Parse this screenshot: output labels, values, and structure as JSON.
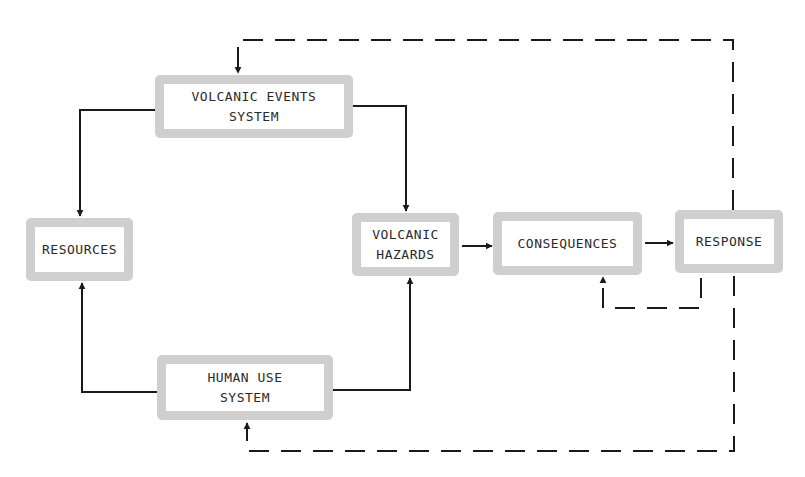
{
  "diagram": {
    "nodes": {
      "volcanic_events": {
        "line1": "VOLCANIC EVENTS",
        "line2": "SYSTEM"
      },
      "resources": {
        "line1": "RESOURCES"
      },
      "volcanic_hazards": {
        "line1": "VOLCANIC",
        "line2": "HAZARDS"
      },
      "consequences": {
        "line1": "CONSEQUENCES"
      },
      "response": {
        "line1": "RESPONSE"
      },
      "human_use": {
        "line1": "HUMAN USE",
        "line2": "SYSTEM"
      }
    },
    "edges": [
      {
        "from": "VOLCANIC EVENTS SYSTEM",
        "to": "RESOURCES",
        "style": "solid"
      },
      {
        "from": "VOLCANIC EVENTS SYSTEM",
        "to": "VOLCANIC HAZARDS",
        "style": "solid"
      },
      {
        "from": "HUMAN USE SYSTEM",
        "to": "RESOURCES",
        "style": "solid"
      },
      {
        "from": "HUMAN USE SYSTEM",
        "to": "VOLCANIC HAZARDS",
        "style": "solid"
      },
      {
        "from": "VOLCANIC HAZARDS",
        "to": "CONSEQUENCES",
        "style": "solid"
      },
      {
        "from": "CONSEQUENCES",
        "to": "RESPONSE",
        "style": "solid"
      },
      {
        "from": "RESPONSE",
        "to": "CONSEQUENCES",
        "style": "dashed"
      },
      {
        "from": "RESPONSE",
        "to": "VOLCANIC EVENTS SYSTEM",
        "style": "dashed"
      },
      {
        "from": "RESPONSE",
        "to": "HUMAN USE SYSTEM",
        "style": "dashed"
      }
    ],
    "colors": {
      "box_border": "#cfcfcf",
      "line": "#1a1a1a",
      "text": "#2a2a2a"
    }
  }
}
